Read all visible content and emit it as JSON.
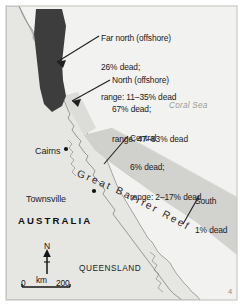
{
  "figure": {
    "region_name": "Great Barrier Reef",
    "country_label": "AUSTRALIA",
    "state_label": "QUEENSLAND",
    "sea_label": "Coral Sea",
    "corner_mark": "4"
  },
  "cities": [
    {
      "name": "Cairns",
      "dot": true
    },
    {
      "name": "Townsville",
      "dot": true
    }
  ],
  "callouts": [
    {
      "id": "far-north",
      "region": "Far north (offshore)",
      "dead_line": "26% dead;",
      "range_line": "range: 11–35% dead",
      "percent_dead": 26,
      "range_low": 11,
      "range_high": 35,
      "shade": "#3d3d3d"
    },
    {
      "id": "north",
      "region": "North (offshore)",
      "dead_line": "67% dead;",
      "range_line": "range: 47–83% dead",
      "percent_dead": 67,
      "range_low": 47,
      "range_high": 83,
      "shade": "#3d3d3d"
    },
    {
      "id": "central",
      "region": "Central",
      "dead_line": "6% dead;",
      "range_line": "range: 2–17% dead",
      "percent_dead": 6,
      "range_low": 2,
      "range_high": 17,
      "shade": "#c9c9c6"
    },
    {
      "id": "south",
      "region": "South",
      "dead_line": "1% dead",
      "range_line": "",
      "percent_dead": 1,
      "range_low": null,
      "range_high": null,
      "shade": "#d6d6d3"
    }
  ],
  "compass": {
    "letter": "N"
  },
  "scale_bar": {
    "zero": "0",
    "unit": "km",
    "max": "200"
  },
  "colors": {
    "sea": "#f2f2f0",
    "land": "#e6e6e3",
    "reef_light": "#d2d2cf",
    "reef_dark": "#3d3d3d",
    "coastline": "#8f8f8c",
    "text": "#1a1a1a",
    "sea_label": "#9b9b9b",
    "frame": "#c8c8c5"
  }
}
